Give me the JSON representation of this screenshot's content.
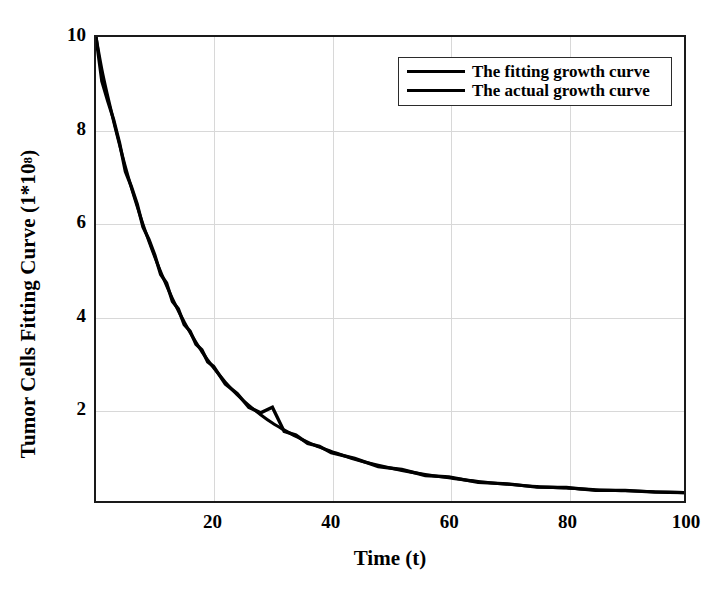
{
  "chart_data": {
    "type": "line",
    "title": "",
    "xlabel": "Time (t)",
    "ylabel": "Tumor Cells Fitting Curve (1*10",
    "ylabel_sup": "8",
    "ylabel_suffix": ")",
    "xlim": [
      0,
      100
    ],
    "ylim": [
      0,
      10
    ],
    "grid": true,
    "legend_position": "top-right",
    "xticks": [
      20,
      40,
      60,
      80,
      100
    ],
    "yticks": [
      2,
      4,
      6,
      8,
      10
    ],
    "xtick_labels": [
      "20",
      "40",
      "60",
      "80",
      "100"
    ],
    "ytick_labels": [
      "2",
      "4",
      "6",
      "8",
      "10"
    ],
    "colors": {
      "fitting_curve": "#000000",
      "actual_curve": "#000000",
      "axis": "#1a1a1a",
      "grid": "#d8d8d8",
      "background": "#ffffff"
    },
    "x": [
      0,
      1,
      2,
      3,
      4,
      5,
      6,
      7,
      8,
      9,
      10,
      11,
      12,
      13,
      14,
      15,
      16,
      17,
      18,
      19,
      20,
      22,
      24,
      26,
      28,
      30,
      32,
      34,
      36,
      38,
      40,
      44,
      48,
      52,
      56,
      60,
      65,
      70,
      75,
      80,
      85,
      90,
      95,
      100
    ],
    "series": [
      {
        "name": "The fitting growth curve",
        "values": [
          10.0,
          9.3,
          8.72,
          8.18,
          7.68,
          7.2,
          6.76,
          6.35,
          5.96,
          5.6,
          5.26,
          4.94,
          4.64,
          4.36,
          4.1,
          3.86,
          3.63,
          3.42,
          3.22,
          3.04,
          2.87,
          2.56,
          2.29,
          2.06,
          1.86,
          1.68,
          1.53,
          1.39,
          1.27,
          1.16,
          1.07,
          0.9,
          0.77,
          0.66,
          0.57,
          0.5,
          0.42,
          0.36,
          0.31,
          0.28,
          0.24,
          0.22,
          0.2,
          0.18
        ]
      },
      {
        "name": "The actual growth curve",
        "values": [
          10.0,
          9.05,
          8.62,
          8.22,
          7.72,
          7.1,
          6.78,
          6.4,
          5.9,
          5.64,
          5.3,
          4.88,
          4.7,
          4.3,
          4.14,
          3.8,
          3.66,
          3.38,
          3.26,
          3.0,
          2.9,
          2.52,
          2.32,
          2.02,
          1.9,
          2.02,
          1.5,
          1.42,
          1.24,
          1.18,
          1.04,
          0.92,
          0.74,
          0.68,
          0.55,
          0.52,
          0.4,
          0.37,
          0.3,
          0.29,
          0.23,
          0.23,
          0.19,
          0.18
        ]
      }
    ]
  },
  "legend": {
    "items": [
      {
        "label": "The fitting growth curve"
      },
      {
        "label": "The actual growth curve"
      }
    ]
  }
}
